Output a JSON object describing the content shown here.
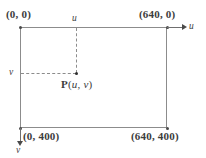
{
  "diagram": {
    "rectangle": {
      "corners": {
        "top_left": "(0, 0)",
        "top_right": "(640, 0)",
        "bottom_left": "(0, 400)",
        "bottom_right": "(640, 400)"
      },
      "width_px": 640,
      "height_px": 400
    },
    "axes": {
      "horizontal_label": "u",
      "vertical_label": "v",
      "horizontal_direction": "right",
      "vertical_direction": "down"
    },
    "point": {
      "name": "P",
      "open_paren": "(",
      "coord_u": "u",
      "separator": ", ",
      "coord_v": "v",
      "close_paren": ")",
      "full_label": "P(u, v)"
    },
    "ticks": {
      "u_tick_label": "u",
      "v_tick_label": "v"
    },
    "colors": {
      "line": "#8c8c8c",
      "arrow": "#4a4a4a",
      "text": "#3c3c3c",
      "background": "#ffffff"
    }
  }
}
